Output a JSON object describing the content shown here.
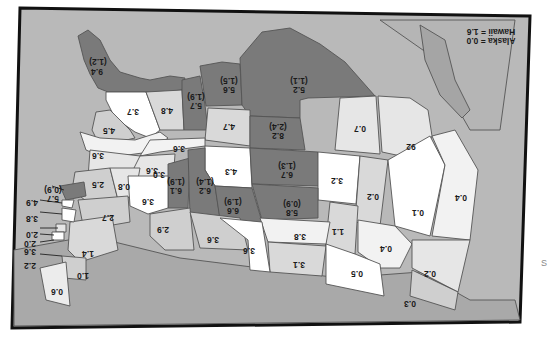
{
  "map": {
    "orientation": "rotated 180 degrees",
    "colors": {
      "background_water": "#b9b9b9",
      "neighbor_land": "#a9a9a9",
      "tier_low": "#ffffff",
      "tier_mid_low": "#e6e6e6",
      "tier_mid": "#cfcfcf",
      "tier_high": "#7a7a7a",
      "border": "#111111"
    },
    "legend_note": {
      "alaska": "Alaska = 0.0",
      "hawaii": "Hawaii = 1.6"
    },
    "regions": [
      {
        "id": "washington",
        "value": "9.4",
        "sub": "(1.2)"
      },
      {
        "id": "oregon",
        "value": "3.7"
      },
      {
        "id": "idaho",
        "value": "4.8"
      },
      {
        "id": "montana-west",
        "value": "5.7",
        "sub": "(1.9)"
      },
      {
        "id": "montana-east",
        "value": "5.6",
        "sub": "(1.5)"
      },
      {
        "id": "north-dakota-region",
        "value": "5.2",
        "sub": "(1.1)"
      },
      {
        "id": "california-north",
        "value": "4.5"
      },
      {
        "id": "wyoming",
        "value": "4.7"
      },
      {
        "id": "south-dakota-region",
        "value": "8.2",
        "sub": "(2.4)"
      },
      {
        "id": "minnesota-region",
        "value": "0.7"
      },
      {
        "id": "wisconsin-region",
        "value": "92"
      },
      {
        "id": "nevada",
        "value": "3.6"
      },
      {
        "id": "utah",
        "value": "3.6"
      },
      {
        "id": "colorado",
        "value": "4.3"
      },
      {
        "id": "nebraska",
        "value": "6.7",
        "sub": "(1.3)"
      },
      {
        "id": "iowa",
        "value": "3.2"
      },
      {
        "id": "illinois",
        "value": "0.2"
      },
      {
        "id": "michigan",
        "value": "0.1"
      },
      {
        "id": "ohio-east",
        "value": "0.4"
      },
      {
        "id": "california-south",
        "value": "3.6"
      },
      {
        "id": "arizona",
        "value": "3.0"
      },
      {
        "id": "new-mexico",
        "value": "6.1",
        "sub": "(1.9)"
      },
      {
        "id": "kansas",
        "value": "6.2",
        "sub": "(1.4)"
      },
      {
        "id": "oklahoma-north",
        "value": "6.6",
        "sub": "(1.9)"
      },
      {
        "id": "missouri",
        "value": "5.8",
        "sub": "(0.9)"
      },
      {
        "id": "indiana",
        "value": "1.1"
      },
      {
        "id": "kentucky",
        "value": "0.4"
      },
      {
        "id": "pennsylvania",
        "value": "0.2"
      },
      {
        "id": "tennessee",
        "value": "3.8"
      },
      {
        "id": "arkansas",
        "value": "3.1"
      },
      {
        "id": "alabama-region",
        "value": "0.5"
      },
      {
        "id": "virginia",
        "value": "0.3"
      },
      {
        "id": "texas-west",
        "value": "2.5"
      },
      {
        "id": "texas-central",
        "value": "0.8"
      },
      {
        "id": "texas-north",
        "value": "3.6"
      },
      {
        "id": "oklahoma",
        "value": "2.9"
      },
      {
        "id": "louisiana-region",
        "value": "3.6"
      },
      {
        "id": "mississippi-region",
        "value": "3.6"
      },
      {
        "id": "georgia-region",
        "value": "2.7"
      },
      {
        "id": "florida-region",
        "value": "1.4"
      },
      {
        "id": "south-carolina",
        "value": "1.0"
      },
      {
        "id": "north-carolina",
        "value": "0.6"
      },
      {
        "id": "new-england-1",
        "value": "5.7",
        "sub": "(0.9)"
      },
      {
        "id": "new-england-2",
        "value": "4.9"
      },
      {
        "id": "new-england-3",
        "value": "3.8"
      },
      {
        "id": "new-england-4",
        "value": "2.0"
      },
      {
        "id": "new-england-5",
        "value": "2.0"
      },
      {
        "id": "new-england-6",
        "value": "3.6"
      },
      {
        "id": "new-england-7",
        "value": "2.2"
      }
    ]
  },
  "stray_text": "S"
}
